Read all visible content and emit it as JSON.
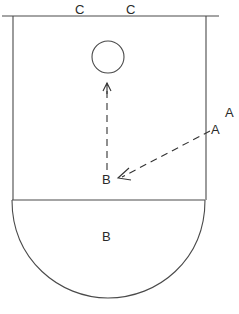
{
  "diagram": {
    "type": "court-play-diagram",
    "colors": {
      "stroke": "#4a4a4a",
      "text": "#2a2a2a",
      "background": "#ffffff"
    },
    "labels": {
      "top_left_c": "C",
      "top_right_c": "C",
      "a_outside": "A",
      "a_inside": "A",
      "b_player": "B",
      "b_zone": "B"
    },
    "elements": {
      "ball": "circle",
      "pass_arrow": "A to B (dashed)",
      "move_arrow": "B upward to ball (dashed)"
    }
  }
}
